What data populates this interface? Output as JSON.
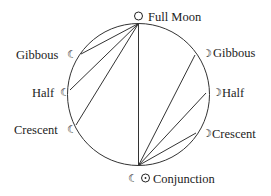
{
  "diagram": {
    "circle": {
      "cx": 138.5,
      "cy": 94.5,
      "r": 71,
      "stroke": "#333333"
    },
    "top_point": {
      "x": 138.5,
      "y": 23.5
    },
    "bottom_point": {
      "x": 138.5,
      "y": 165.5
    },
    "labels": {
      "full_moon": "Full Moon",
      "conjunction": "Conjunction",
      "left_gibbous": "Gibbous",
      "left_half": "Half",
      "left_crescent": "Crescent",
      "right_gibbous": "Gibbous",
      "right_half": "Half",
      "right_crescent": "Crescent"
    },
    "symbols": {
      "full_moon": "○",
      "sun": "⊙",
      "waning_moon": "☾",
      "waxing_moon": "☽"
    },
    "chords_from_top": [
      {
        "x": 81,
        "y": 54
      },
      {
        "x": 70,
        "y": 90
      },
      {
        "x": 76,
        "y": 125
      },
      {
        "x": 138.5,
        "y": 165.5
      }
    ],
    "chords_from_bottom": [
      {
        "x": 195,
        "y": 55
      },
      {
        "x": 206,
        "y": 93
      },
      {
        "x": 196,
        "y": 133
      }
    ]
  }
}
